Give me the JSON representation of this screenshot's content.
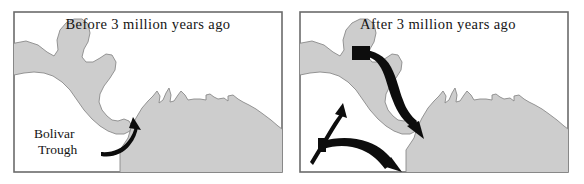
{
  "figure": {
    "kind": "two-panel-paleogeographic-map",
    "background_color": "#ffffff",
    "land_color": "#cdcdcd",
    "land_outline_color": "#8a8a8a",
    "frame_color": "#6b6b6b",
    "arrow_color": "#0d0d0d"
  },
  "panels": [
    {
      "id": "before",
      "title": "Before 3 million years ago",
      "labels": [
        {
          "id": "bolivar-trough",
          "line1": "Bolivar",
          "line2": "Trough"
        }
      ],
      "arrows": [
        {
          "id": "bolivar-trough-pointer",
          "style": "thin-curved",
          "direction": "up-right"
        }
      ]
    },
    {
      "id": "after",
      "title": "After 3 million years ago",
      "labels": [],
      "arrows": [
        {
          "id": "current-upper",
          "style": "thick-curved",
          "direction": "down-right"
        },
        {
          "id": "current-lower",
          "style": "thick-curved",
          "direction": "down-right"
        },
        {
          "id": "current-northwest",
          "style": "thin-curved",
          "direction": "up-left"
        }
      ]
    }
  ]
}
